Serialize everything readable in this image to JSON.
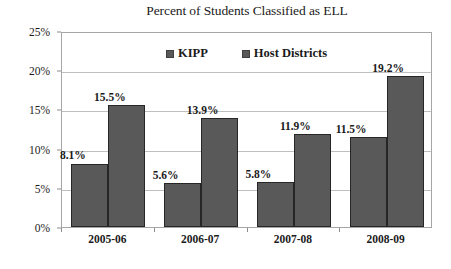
{
  "chart_data": {
    "type": "bar",
    "title": "Percent of Students Classified as ELL",
    "xlabel": "",
    "ylabel": "",
    "categories": [
      "2005-06",
      "2006-07",
      "2007-08",
      "2008-09"
    ],
    "series": [
      {
        "name": "KIPP",
        "values": [
          8.1,
          5.6,
          5.8,
          11.5
        ],
        "color": "#595959"
      },
      {
        "name": "Host Districts",
        "values": [
          15.5,
          13.9,
          11.9,
          19.2
        ],
        "color": "#595959"
      }
    ],
    "data_labels": [
      [
        "8.1%",
        "15.5%"
      ],
      [
        "5.6%",
        "13.9%"
      ],
      [
        "5.8%",
        "11.9%"
      ],
      [
        "11.5%",
        "19.2%"
      ]
    ],
    "ylim": [
      0,
      25
    ],
    "y_tick_values": [
      0,
      5,
      10,
      15,
      20,
      25
    ],
    "y_tick_labels": [
      "0%",
      "5%",
      "10%",
      "15%",
      "20%",
      "25%"
    ],
    "grid": true,
    "grid_axis": "y",
    "legend_position": "top-center",
    "legend": [
      "KIPP",
      "Host Districts"
    ],
    "plot_border_color": "#a6a6a6",
    "gridline_color": "#bfbfbf",
    "background": "#ffffff"
  }
}
